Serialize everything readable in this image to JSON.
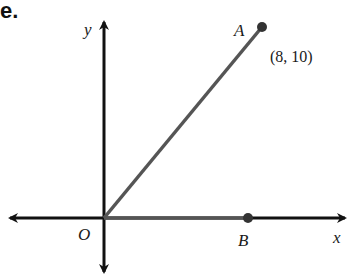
{
  "heading_fragment": "e.",
  "axes": {
    "x_label": "x",
    "y_label": "y",
    "origin_label": "O"
  },
  "points": {
    "A": {
      "label": "A",
      "coords_text": "(8, 10)"
    },
    "B": {
      "label": "B"
    }
  },
  "colors": {
    "axes": "#111111",
    "segments": "#555555",
    "points": "#333333"
  }
}
